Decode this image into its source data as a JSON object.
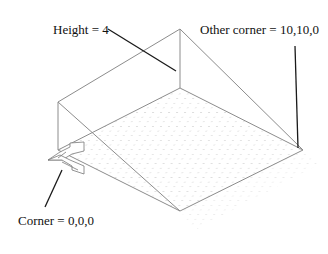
{
  "diagram": {
    "labels": {
      "height": "Height = 4",
      "other_corner": "Other corner = 10,10,0",
      "corner": "Corner = 0,0,0"
    },
    "colors": {
      "edge": "#8c8c8c",
      "leader": "#1a1a1a",
      "grid_dot": "#c8c8c8"
    }
  }
}
